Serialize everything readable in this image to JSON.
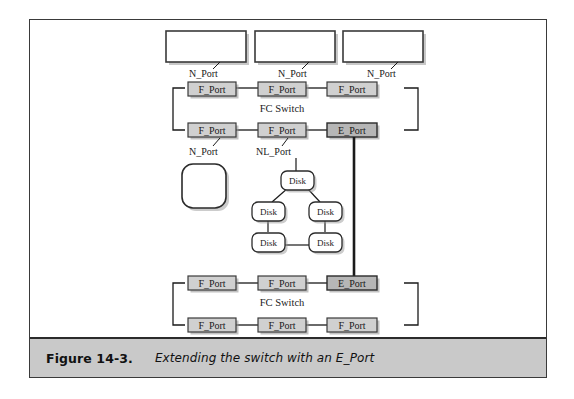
{
  "figure": {
    "caption_label": "Figure 14-3.",
    "caption_text": "Extending the switch with an E_Port"
  },
  "colors": {
    "frame_border": "#3a3a3a",
    "caption_background": "#c9c9c9",
    "f_port_fill": "#d0d0d0",
    "e_port_fill": "#b6b6b6",
    "node_fill": "#ffffff",
    "disk_fill": "#ffffff",
    "line": "#1a1a1a",
    "shadow": "#9a9a9a"
  },
  "diagram": {
    "type": "network-topology",
    "top_nodes": [
      {
        "name": "node-1",
        "label": "",
        "port_label": "N_Port"
      },
      {
        "name": "node-2",
        "label": "",
        "port_label": "N_Port"
      },
      {
        "name": "node-3",
        "label": "",
        "port_label": "N_Port"
      }
    ],
    "upper_switch": {
      "title": "FC Switch",
      "top_row_ports": [
        {
          "label": "F_Port",
          "type": "F"
        },
        {
          "label": "F_Port",
          "type": "F"
        },
        {
          "label": "F_Port",
          "type": "F"
        }
      ],
      "bottom_row_ports": [
        {
          "label": "F_Port",
          "type": "F"
        },
        {
          "label": "F_Port",
          "type": "F"
        },
        {
          "label": "E_Port",
          "type": "E"
        }
      ]
    },
    "lower_switch": {
      "title": "FC Switch",
      "top_row_ports": [
        {
          "label": "F_Port",
          "type": "F"
        },
        {
          "label": "F_Port",
          "type": "F"
        },
        {
          "label": "E_Port",
          "type": "E"
        }
      ],
      "bottom_row_ports": [
        {
          "label": "F_Port",
          "type": "F"
        },
        {
          "label": "F_Port",
          "type": "F"
        },
        {
          "label": "F_Port",
          "type": "F"
        }
      ]
    },
    "bottom_attachments": [
      {
        "name": "host-device",
        "port_label": "N_Port",
        "shape": "rounded-square",
        "label": ""
      },
      {
        "name": "disk-loop",
        "port_label": "NL_Port",
        "shape": "arbitrated-loop",
        "disks": [
          {
            "label": "Disk"
          },
          {
            "label": "Disk"
          },
          {
            "label": "Disk"
          },
          {
            "label": "Disk"
          },
          {
            "label": "Disk"
          }
        ]
      }
    ],
    "inter_switch_link": {
      "name": "e-port-isl",
      "label": ""
    }
  }
}
